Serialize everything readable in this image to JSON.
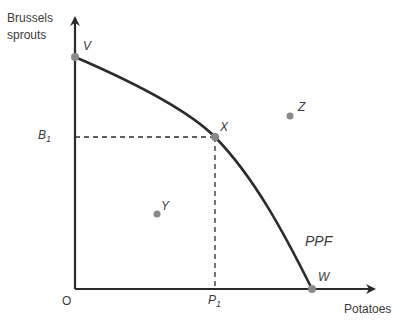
{
  "diagram": {
    "type": "production-possibility-frontier",
    "y_axis_label_line1": "Brussels",
    "y_axis_label_line2": "sprouts",
    "x_axis_label": "Potatoes",
    "origin_label": "O",
    "curve_label": "PPF",
    "y_ref_label": "B",
    "y_ref_sub": "1",
    "x_ref_label": "P",
    "x_ref_sub": "1",
    "points": [
      {
        "id": "V",
        "label": "V",
        "description": "y-intercept of PPF"
      },
      {
        "id": "X",
        "label": "X",
        "description": "on PPF at (P1, B1)"
      },
      {
        "id": "W",
        "label": "W",
        "description": "x-intercept of PPF"
      },
      {
        "id": "Y",
        "label": "Y",
        "description": "inside PPF"
      },
      {
        "id": "Z",
        "label": "Z",
        "description": "outside PPF"
      }
    ],
    "colors": {
      "line": "#2b2b2b",
      "point": "#8a8a8a",
      "text": "#3a3a3a"
    }
  }
}
